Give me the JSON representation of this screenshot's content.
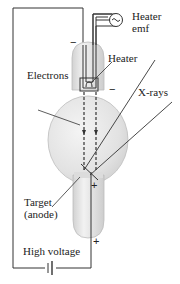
{
  "labels": {
    "heater_emf_line1": "Heater",
    "heater_emf_line2": "emf",
    "heater": "Heater",
    "electrons": "Electrons",
    "xrays": "X-rays",
    "target_line1": "Target",
    "target_line2": "(anode)",
    "high_voltage": "High voltage"
  },
  "signs": {
    "cathode_top": "−",
    "cathode_side": "−",
    "anode_inner": "+",
    "anode_bottom": "+"
  },
  "icons": {
    "ac_source": "~",
    "battery": "battery-symbol"
  },
  "colors": {
    "tube_fill": "#e4e4e4",
    "tube_edge": "#b9b9b9",
    "line": "#333333"
  }
}
